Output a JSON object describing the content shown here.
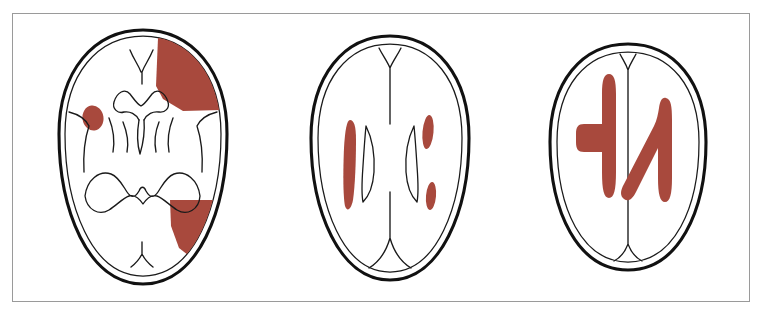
{
  "figure": {
    "panel_count": 3,
    "frame_border_color": "#9a9a9a",
    "background_color": "#ffffff",
    "outline_color": "#111111",
    "lesion_color": "#a8493d"
  },
  "panels": [
    {
      "id": "panel-1",
      "label": "Lower axial section (basal ganglia / midbrain level)",
      "structures": [
        "skull-outline",
        "brain-surface",
        "frontal-interhemispheric-fissure",
        "lateral-ventricle-frontal-horns",
        "third-ventricle",
        "basal-ganglia-curves",
        "sylvian-fissures",
        "tentorium-cerebellum-outline",
        "occipital-fissure"
      ],
      "lesions": [
        {
          "name": "right-frontal-wedge-lesion",
          "shape": "wedge",
          "region": "right frontal cortex",
          "color": "#a8493d"
        },
        {
          "name": "left-basal-ganglia-oval-lesion",
          "shape": "oval",
          "region": "left lentiform nucleus",
          "color": "#a8493d"
        },
        {
          "name": "right-posterior-wedge-lesion",
          "shape": "wedge",
          "region": "right occipital cortex",
          "color": "#a8493d"
        }
      ]
    },
    {
      "id": "panel-2",
      "label": "Mid axial section (lateral ventricle body level)",
      "structures": [
        "skull-outline",
        "brain-surface",
        "anterior-interhemispheric-fissure",
        "posterior-interhemispheric-fissure",
        "left-lateral-ventricle",
        "right-lateral-ventricle"
      ],
      "lesions": [
        {
          "name": "left-periventricular-streak-lesion",
          "shape": "elongated-streak",
          "region": "left corona radiata",
          "color": "#a8493d"
        },
        {
          "name": "right-anterior-oval-lesion",
          "shape": "small-oval",
          "region": "right anterior corona radiata",
          "color": "#a8493d"
        },
        {
          "name": "right-posterior-oval-lesion",
          "shape": "small-oval",
          "region": "right posterior corona radiata",
          "color": "#a8493d"
        }
      ]
    },
    {
      "id": "panel-3",
      "label": "High axial section (centrum semiovale level)",
      "structures": [
        "skull-outline",
        "brain-surface",
        "interhemispheric-fissure"
      ],
      "lesions": [
        {
          "name": "left-centrum-semiovale-lesion",
          "shape": "vertical-bar-with-lateral-stub",
          "region": "left centrum semiovale",
          "color": "#a8493d"
        },
        {
          "name": "right-centrum-semiovale-lesion",
          "shape": "vertical-bar-with-diagonal-stroke",
          "region": "right centrum semiovale",
          "color": "#a8493d"
        }
      ]
    }
  ]
}
